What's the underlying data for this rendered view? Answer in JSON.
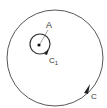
{
  "diagram": {
    "labels": {
      "point": "A",
      "inner_curve": "C",
      "inner_curve_subscript": "1",
      "outer_curve": "C"
    },
    "colors": {
      "stroke": "#444444",
      "text": "#333333",
      "background": "#ffffff"
    }
  }
}
